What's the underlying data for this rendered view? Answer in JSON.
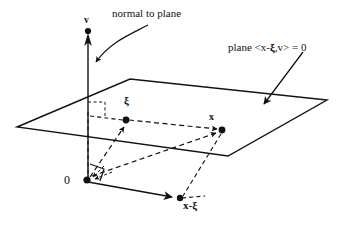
{
  "figure": {
    "background_color": "#ffffff",
    "ink_color": "#111111",
    "width": 347,
    "height": 233
  },
  "labels": {
    "normal_to_plane": "normal to plane",
    "plane_equation": "plane <x-ξ,v> = 0",
    "plane_equation_parts": {
      "prefix": "plane <x-",
      "xi": "ξ",
      "suffix": ",v> = 0"
    },
    "axis_v": "v",
    "point_xi": "ξ",
    "point_x": "x",
    "origin": "0",
    "vector_x_minus_xi": "x-ξ",
    "vector_x_minus_xi_parts": {
      "prefix": "x-",
      "xi": "ξ"
    }
  },
  "geometry": {
    "plane_corners": [
      {
        "name": "left",
        "x": 17,
        "y": 127
      },
      {
        "name": "top",
        "x": 130,
        "y": 79
      },
      {
        "name": "right",
        "x": 327,
        "y": 100
      },
      {
        "name": "bottom",
        "x": 228,
        "y": 156
      }
    ],
    "points": [
      {
        "name": "v-tip",
        "x": 88,
        "y": 32
      },
      {
        "name": "xi",
        "x": 126,
        "y": 120
      },
      {
        "name": "x",
        "x": 222,
        "y": 130
      },
      {
        "name": "origin",
        "x": 87,
        "y": 180
      },
      {
        "name": "x-minus-xi",
        "x": 180,
        "y": 198
      }
    ],
    "annotation_arrows": [
      {
        "name": "normal-to-plane-curved-arrow",
        "from": [
          148,
          26
        ],
        "to": [
          92,
          64
        ]
      },
      {
        "name": "plane-label-arrow",
        "from": [
          300,
          54
        ],
        "to": [
          262,
          105
        ]
      }
    ],
    "right_angle_markers": [
      {
        "name": "plane-v-axis-right-angle",
        "x": 96,
        "y": 103,
        "style": "dashed"
      },
      {
        "name": "origin-right-angle",
        "x": 90,
        "y": 164,
        "style": "solid"
      }
    ]
  }
}
